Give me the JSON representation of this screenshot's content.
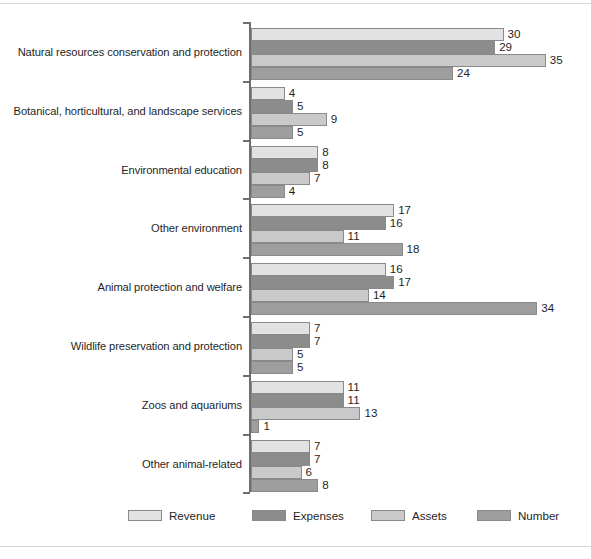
{
  "chart_data": {
    "type": "bar",
    "orientation": "horizontal",
    "title": "",
    "subtitle": "",
    "xlabel": "",
    "ylabel": "",
    "grid": false,
    "xlim": [
      0,
      35
    ],
    "legend_position": "bottom",
    "value_labels": true,
    "categories": [
      "Natural resources conservation and protection",
      "Botanical, horticultural, and landscape services",
      "Environmental education",
      "Other environment",
      "Animal protection and welfare",
      "Wildlife preservation and protection",
      "Zoos and aquariums",
      "Other animal-related"
    ],
    "series": [
      {
        "name": "Revenue",
        "color": "#e2e2e2",
        "values": [
          30,
          4,
          8,
          17,
          16,
          7,
          11,
          7
        ]
      },
      {
        "name": "Expenses",
        "color": "#8c8c8c",
        "values": [
          29,
          5,
          8,
          16,
          17,
          7,
          11,
          7
        ]
      },
      {
        "name": "Assets",
        "color": "#c9c9c9",
        "values": [
          35,
          9,
          7,
          11,
          14,
          5,
          13,
          6
        ]
      },
      {
        "name": "Number",
        "color": "#9e9e9e",
        "values": [
          24,
          5,
          4,
          18,
          34,
          5,
          1,
          8
        ]
      }
    ]
  },
  "legend": {
    "items": [
      {
        "label": "Revenue"
      },
      {
        "label": "Expenses"
      },
      {
        "label": "Assets"
      },
      {
        "label": "Number"
      }
    ]
  },
  "colors": {
    "revenue": "#e2e2e2",
    "expenses": "#8c8c8c",
    "assets": "#c9c9c9",
    "number": "#9e9e9e",
    "axis": "#6e6e6e",
    "bar_outline": "#8a8a8a",
    "rule": "#d6d6d6",
    "text": "#1f1f1f"
  }
}
